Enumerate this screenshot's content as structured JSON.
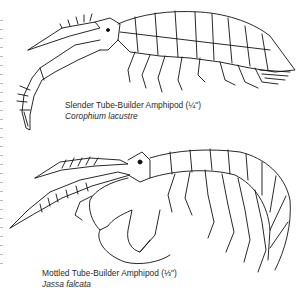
{
  "document": {
    "figures": [
      {
        "id": "slender-tube-builder",
        "common_name": "Slender Tube-Builder Amphipod (¼\")",
        "scientific_name": "Corophium lacustre"
      },
      {
        "id": "mottled-tube-builder",
        "common_name": "Mottled Tube-Builder Amphipod (⅓\")",
        "scientific_name": "Jassa falcata"
      }
    ]
  }
}
